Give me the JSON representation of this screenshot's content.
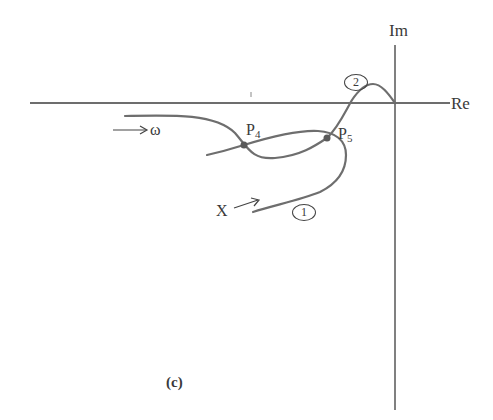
{
  "figure": {
    "caption": "(c)",
    "axes": {
      "real_label": "Re",
      "imag_label": "Im"
    },
    "annotations": {
      "omega_arrow_label": "ω",
      "x_arrow_label": "X",
      "intersection_points": [
        {
          "name": "P",
          "sub": "4"
        },
        {
          "name": "P",
          "sub": "5"
        }
      ],
      "curve_labels": [
        "1",
        "2"
      ]
    },
    "colors": {
      "axis": "#3c3c3c",
      "curve": "#6e6e6e",
      "point": "#5a5a5a"
    }
  }
}
